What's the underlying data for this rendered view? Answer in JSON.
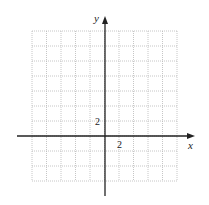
{
  "chart_data": {
    "type": "coordinate-grid",
    "title": "",
    "xlabel": "x",
    "ylabel": "y",
    "x_tick_label": "2",
    "y_tick_label": "2",
    "grid": true,
    "grid_style": "dotted",
    "grid_columns": 10,
    "grid_rows": 10,
    "units_per_grid_square": 1,
    "xlim": [
      -5,
      5
    ],
    "ylim": [
      -3,
      7
    ]
  },
  "labels": {
    "x_axis": "x",
    "y_axis": "y",
    "x_tick": "2",
    "y_tick": "2"
  },
  "colors": {
    "grid": "#b8b8b8",
    "axis": "#222222"
  }
}
